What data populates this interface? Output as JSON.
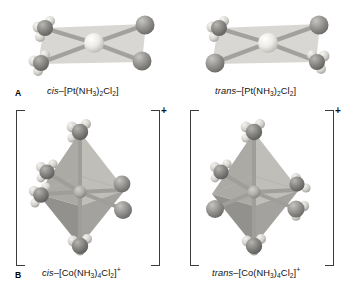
{
  "figure": {
    "background": "#ffffff"
  },
  "panels": [
    {
      "letter": "A",
      "geometry": "square planar",
      "metal": "Pt",
      "structures": [
        {
          "id": "cis-platin",
          "prefix": "cis",
          "dash": "–",
          "formula_open": "[Pt(NH",
          "sub1": "3",
          "mid": ")",
          "sub2": "2",
          "cl": "Cl",
          "sub3": "2",
          "formula_close": "]",
          "charge": "",
          "bracketed": false,
          "ligands": "two NH3 adjacent, two Cl adjacent"
        },
        {
          "id": "trans-platin",
          "prefix": "trans",
          "dash": "–",
          "formula_open": "[Pt(NH",
          "sub1": "3",
          "mid": ")",
          "sub2": "2",
          "cl": "Cl",
          "sub3": "2",
          "formula_close": "]",
          "charge": "",
          "bracketed": false,
          "ligands": "two NH3 opposite, two Cl opposite"
        }
      ]
    },
    {
      "letter": "B",
      "geometry": "octahedral",
      "metal": "Co",
      "structures": [
        {
          "id": "cis-cobalt",
          "prefix": "cis",
          "dash": "–",
          "formula_open": "[Co(NH",
          "sub1": "3",
          "mid": ")",
          "sub2": "4",
          "cl": "Cl",
          "sub3": "2",
          "formula_close": "]",
          "charge": "+",
          "bracketed": true,
          "bracket_charge": "+",
          "ligands": "four NH3, two Cl adjacent (90 degrees)"
        },
        {
          "id": "trans-cobalt",
          "prefix": "trans",
          "dash": "–",
          "formula_open": "[Co(NH",
          "sub1": "3",
          "mid": ")",
          "sub2": "4",
          "cl": "Cl",
          "sub3": "2",
          "formula_close": "]",
          "charge": "+",
          "bracketed": true,
          "bracket_charge": "+",
          "ligands": "four NH3, two Cl opposite (180 degrees)"
        }
      ]
    }
  ],
  "colors": {
    "metal_center": "#e8e6e2",
    "chlorine": "#8d8d8d",
    "nitrogen": "#7c7c7c",
    "hydrogen": "#d9d7d2",
    "bond": "#9a9a96",
    "plane_fill": "#b9b7b2",
    "octahedron_light": "#b2b0ab",
    "octahedron_mid": "#9d9b96",
    "octahedron_dark": "#85837e",
    "bracket": "#3b3b3b",
    "text": "#111111"
  }
}
